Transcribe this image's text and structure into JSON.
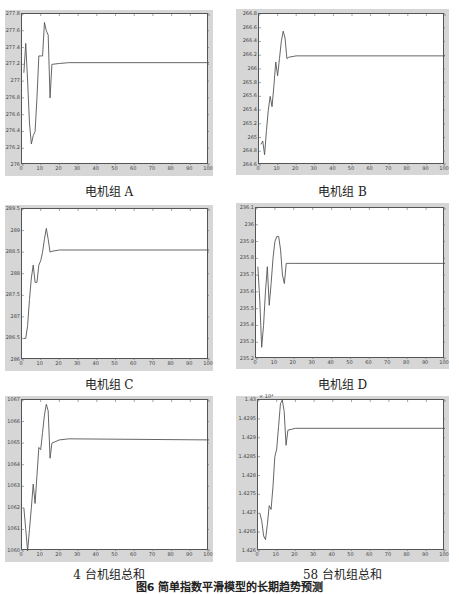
{
  "figure_caption": "图6  简单指数平滑模型的长期趋势预测",
  "colors": {
    "frame": "#d6d6d6",
    "line": "#555555",
    "axis": "#444444"
  },
  "chart_data": [
    {
      "type": "line",
      "title": "电机组 A",
      "xlabel": "",
      "ylabel": "",
      "xlim": [
        0,
        100
      ],
      "ylim": [
        276,
        277.8
      ],
      "xticks": [
        0,
        10,
        20,
        30,
        40,
        50,
        60,
        70,
        80,
        90,
        100
      ],
      "yticks": [
        276,
        276.2,
        276.4,
        276.6,
        276.8,
        277,
        277.2,
        277.4,
        277.6,
        277.8
      ],
      "ytick_labels": [
        "276",
        "276.2",
        "276.4",
        "276.6",
        "276.8",
        "277",
        "277.2",
        "277.4",
        "277.6",
        "277.8"
      ],
      "grid": false,
      "series": [
        {
          "name": "电机组 A",
          "x": [
            1,
            2,
            3,
            4,
            5,
            6,
            7,
            8,
            9,
            10,
            11,
            12,
            13,
            14,
            15,
            16,
            20,
            25,
            100
          ],
          "y": [
            277.1,
            277.45,
            277.0,
            276.5,
            276.25,
            276.35,
            276.4,
            276.8,
            277.3,
            277.3,
            277.3,
            277.7,
            277.6,
            277.55,
            276.8,
            277.2,
            277.21,
            277.22,
            277.22
          ]
        }
      ]
    },
    {
      "type": "line",
      "title": "电机组 B",
      "xlabel": "",
      "ylabel": "",
      "xlim": [
        0,
        100
      ],
      "ylim": [
        264.6,
        266.8
      ],
      "xticks": [
        0,
        10,
        20,
        30,
        40,
        50,
        60,
        70,
        80,
        90,
        100
      ],
      "yticks": [
        264.6,
        264.8,
        265,
        265.2,
        265.4,
        265.6,
        265.8,
        266,
        266.2,
        266.4,
        266.6,
        266.8
      ],
      "ytick_labels": [
        "264.6",
        "264.8",
        "265",
        "265.2",
        "265.4",
        "265.6",
        "265.8",
        "266",
        "266.2",
        "266.4",
        "266.6",
        "266.8"
      ],
      "grid": false,
      "series": [
        {
          "name": "电机组 B",
          "x": [
            1,
            2,
            3,
            4,
            5,
            6,
            7,
            8,
            9,
            10,
            11,
            12,
            13,
            14,
            15,
            16,
            20,
            100
          ],
          "y": [
            264.9,
            264.95,
            264.75,
            265.1,
            265.4,
            265.6,
            265.45,
            265.75,
            266.1,
            265.9,
            266.15,
            266.4,
            266.55,
            266.45,
            266.15,
            266.17,
            266.19,
            266.19
          ]
        }
      ]
    },
    {
      "type": "line",
      "title": "电机组 C",
      "xlabel": "",
      "ylabel": "",
      "xlim": [
        0,
        100
      ],
      "ylim": [
        286,
        289.5
      ],
      "xticks": [
        0,
        10,
        20,
        30,
        40,
        50,
        60,
        70,
        80,
        90,
        100
      ],
      "yticks": [
        286,
        286.5,
        287,
        287.5,
        288,
        288.5,
        289,
        289.5
      ],
      "ytick_labels": [
        "286",
        "286.5",
        "287",
        "287.5",
        "288",
        "288.5",
        "289",
        "289.5"
      ],
      "grid": false,
      "series": [
        {
          "name": "电机组 C",
          "x": [
            1,
            2,
            3,
            4,
            5,
            6,
            7,
            8,
            9,
            10,
            11,
            12,
            13,
            14,
            15,
            16,
            20,
            100
          ],
          "y": [
            286.5,
            286.5,
            286.8,
            287.4,
            287.9,
            288.2,
            287.8,
            287.8,
            288.2,
            288.3,
            288.5,
            288.8,
            289.05,
            288.8,
            288.5,
            288.52,
            288.55,
            288.55
          ]
        }
      ]
    },
    {
      "type": "line",
      "title": "电机组 D",
      "xlabel": "",
      "ylabel": "",
      "xlim": [
        0,
        100
      ],
      "ylim": [
        235.2,
        236.1
      ],
      "xticks": [
        0,
        10,
        20,
        30,
        40,
        50,
        60,
        70,
        80,
        90,
        100
      ],
      "yticks": [
        235.2,
        235.3,
        235.4,
        235.5,
        235.6,
        235.7,
        235.8,
        235.9,
        236,
        236.1
      ],
      "ytick_labels": [
        "235.2",
        "235.3",
        "235.4",
        "235.5",
        "235.6",
        "235.7",
        "235.8",
        "235.9",
        "236",
        "236.1"
      ],
      "grid": false,
      "series": [
        {
          "name": "电机组 D",
          "x": [
            1,
            2,
            3,
            4,
            5,
            6,
            7,
            8,
            9,
            10,
            11,
            12,
            13,
            14,
            15,
            16,
            20,
            100
          ],
          "y": [
            235.75,
            235.55,
            235.27,
            235.4,
            235.6,
            235.75,
            235.52,
            235.65,
            235.8,
            235.9,
            235.93,
            235.93,
            235.85,
            235.7,
            235.65,
            235.77,
            235.77,
            235.77
          ]
        }
      ]
    },
    {
      "type": "line",
      "title": "4 台机组总和",
      "xlabel": "",
      "ylabel": "",
      "xlim": [
        0,
        100
      ],
      "ylim": [
        1060,
        1067
      ],
      "xticks": [
        0,
        10,
        20,
        30,
        40,
        50,
        60,
        70,
        80,
        90,
        100
      ],
      "yticks": [
        1060,
        1061,
        1062,
        1063,
        1064,
        1065,
        1066,
        1067
      ],
      "ytick_labels": [
        "1060",
        "1061",
        "1062",
        "1063",
        "1064",
        "1065",
        "1066",
        "1067"
      ],
      "grid": false,
      "series": [
        {
          "name": "4 台机组总和",
          "x": [
            1,
            2,
            3,
            4,
            5,
            6,
            7,
            8,
            9,
            10,
            11,
            12,
            13,
            14,
            15,
            16,
            20,
            25,
            100
          ],
          "y": [
            1062,
            1061,
            1060,
            1061,
            1062,
            1063.1,
            1062.2,
            1063.5,
            1064.8,
            1064.7,
            1065.5,
            1066.3,
            1066.8,
            1066.5,
            1064.3,
            1065.0,
            1065.15,
            1065.2,
            1065.15
          ]
        }
      ]
    },
    {
      "type": "line",
      "title": "58 台机组总和",
      "xlabel": "",
      "ylabel": "",
      "y_multiplier": "× 10⁴",
      "xlim": [
        0,
        100
      ],
      "ylim": [
        1.426,
        1.43
      ],
      "xticks": [
        0,
        10,
        20,
        30,
        40,
        50,
        60,
        70,
        80,
        90,
        100
      ],
      "yticks": [
        1.426,
        1.4265,
        1.427,
        1.4275,
        1.428,
        1.4285,
        1.429,
        1.4295,
        1.43
      ],
      "ytick_labels": [
        "1.426",
        "1.4265",
        "1.427",
        "1.4275",
        "1.428",
        "1.4285",
        "1.429",
        "1.4295",
        "1.43"
      ],
      "grid": false,
      "series": [
        {
          "name": "58 台机组总和",
          "x": [
            1,
            2,
            3,
            4,
            5,
            6,
            7,
            8,
            9,
            10,
            11,
            12,
            13,
            14,
            15,
            16,
            20,
            100
          ],
          "y": [
            1.427,
            1.4268,
            1.4264,
            1.4263,
            1.4267,
            1.4272,
            1.4271,
            1.4277,
            1.4285,
            1.4287,
            1.4293,
            1.4299,
            1.43,
            1.4297,
            1.4288,
            1.4292,
            1.42925,
            1.42925
          ]
        }
      ]
    }
  ],
  "layout": [
    {
      "frame": [
        5,
        10,
        208,
        166
      ],
      "plot": [
        21,
        13,
        187,
        151
      ],
      "caption_top": 182
    },
    {
      "frame": [
        236,
        9,
        213,
        166
      ],
      "plot": [
        258,
        13,
        186,
        151
      ],
      "caption_top": 182
    },
    {
      "frame": [
        5,
        205,
        208,
        166
      ],
      "plot": [
        21,
        208,
        187,
        151
      ],
      "caption_top": 375
    },
    {
      "frame": [
        236,
        203,
        213,
        166
      ],
      "plot": [
        255,
        207,
        189,
        151
      ],
      "caption_top": 375
    },
    {
      "frame": [
        5,
        396,
        208,
        166
      ],
      "plot": [
        21,
        399,
        187,
        151
      ],
      "caption_top": 565
    },
    {
      "frame": [
        236,
        396,
        213,
        166
      ],
      "plot": [
        257,
        399,
        187,
        151
      ],
      "caption_top": 565
    }
  ]
}
